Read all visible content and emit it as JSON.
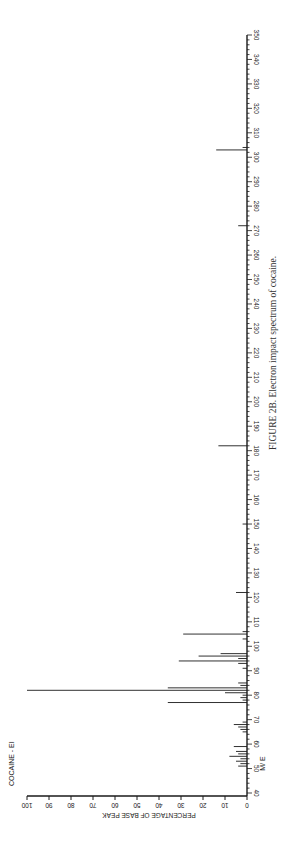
{
  "chart_data": {
    "type": "bar",
    "title": "COCAINE - EI",
    "xlabel": "M/ E",
    "ylabel": "PERCENTAGE OF BASE PEAK",
    "xlim": [
      40,
      350
    ],
    "ylim": [
      0,
      100
    ],
    "orientation": "rotated -90deg (m/z axis vertical, intensity horizontal)",
    "x_ticks": [
      40,
      50,
      60,
      70,
      80,
      90,
      100,
      110,
      120,
      130,
      140,
      150,
      160,
      170,
      180,
      190,
      200,
      210,
      220,
      230,
      240,
      250,
      260,
      270,
      280,
      290,
      300,
      310,
      320,
      330,
      340,
      350
    ],
    "y_ticks": [
      0,
      10,
      20,
      30,
      40,
      50,
      60,
      70,
      80,
      90,
      100
    ],
    "peaks": [
      {
        "mz": 51,
        "intensity": 4
      },
      {
        "mz": 52,
        "intensity": 3
      },
      {
        "mz": 53,
        "intensity": 5
      },
      {
        "mz": 54,
        "intensity": 3
      },
      {
        "mz": 55,
        "intensity": 8
      },
      {
        "mz": 56,
        "intensity": 4
      },
      {
        "mz": 57,
        "intensity": 5
      },
      {
        "mz": 59,
        "intensity": 6
      },
      {
        "mz": 65,
        "intensity": 2
      },
      {
        "mz": 66,
        "intensity": 3
      },
      {
        "mz": 67,
        "intensity": 4
      },
      {
        "mz": 68,
        "intensity": 6
      },
      {
        "mz": 69,
        "intensity": 2
      },
      {
        "mz": 77,
        "intensity": 36
      },
      {
        "mz": 78,
        "intensity": 2
      },
      {
        "mz": 79,
        "intensity": 3
      },
      {
        "mz": 80,
        "intensity": 2
      },
      {
        "mz": 81,
        "intensity": 10
      },
      {
        "mz": 82,
        "intensity": 100
      },
      {
        "mz": 83,
        "intensity": 36
      },
      {
        "mz": 84,
        "intensity": 3
      },
      {
        "mz": 85,
        "intensity": 4
      },
      {
        "mz": 91,
        "intensity": 2
      },
      {
        "mz": 93,
        "intensity": 4
      },
      {
        "mz": 94,
        "intensity": 31
      },
      {
        "mz": 95,
        "intensity": 4
      },
      {
        "mz": 96,
        "intensity": 22
      },
      {
        "mz": 97,
        "intensity": 12
      },
      {
        "mz": 103,
        "intensity": 2
      },
      {
        "mz": 105,
        "intensity": 29
      },
      {
        "mz": 106,
        "intensity": 2
      },
      {
        "mz": 122,
        "intensity": 5
      },
      {
        "mz": 150,
        "intensity": 2
      },
      {
        "mz": 182,
        "intensity": 13
      },
      {
        "mz": 272,
        "intensity": 4
      },
      {
        "mz": 303,
        "intensity": 14
      },
      {
        "mz": 304,
        "intensity": 2
      }
    ]
  },
  "caption": "FIGURE 2B.    Electron impact spectrum of cocaine."
}
